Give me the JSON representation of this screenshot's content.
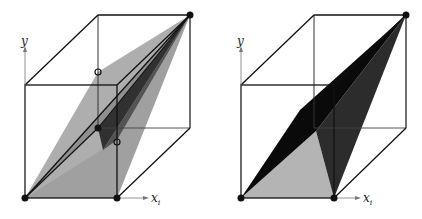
{
  "figure": {
    "panels": [
      {
        "id": "left",
        "axis_y_label": "y",
        "axis_x_label": "x",
        "axis_x_subscript": "i",
        "description": "Unit cube with several translucent gray triangular facets sharing the top-back-right vertex; open circles on back-left edge and front-right edge"
      },
      {
        "id": "right",
        "axis_y_label": "y",
        "axis_x_label": "x",
        "axis_x_subscript": "i",
        "description": "Unit cube with a light-gray bottom triangle and two dark triangular facets reaching the top-back-right vertex"
      }
    ],
    "colors": {
      "edge": "#111111",
      "light_gray": "#b8b8b8",
      "mid_gray": "#8a8a8a",
      "dark": "#2a2a2a",
      "black": "#0a0a0a"
    }
  }
}
